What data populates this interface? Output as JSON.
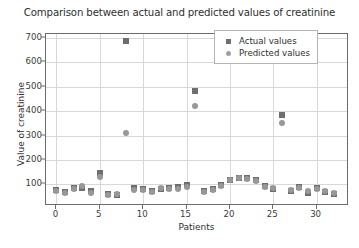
{
  "chart_data": {
    "type": "scatter",
    "title": "Comparison between actual and predicted values of creatinine",
    "xlabel": "Patients",
    "ylabel": "Value of creatinine",
    "xlim": [
      -1.2,
      33.5
    ],
    "ylim": [
      20,
      715
    ],
    "grid": true,
    "legend_position": "upper right",
    "xticks": [
      0,
      5,
      10,
      15,
      20,
      25,
      30
    ],
    "yticks": [
      100,
      200,
      300,
      400,
      500,
      600,
      700
    ],
    "x": [
      0,
      1,
      2,
      3,
      4,
      5,
      6,
      7,
      8,
      9,
      10,
      11,
      12,
      13,
      14,
      15,
      16,
      17,
      18,
      19,
      20,
      21,
      22,
      23,
      24,
      25,
      26,
      27,
      28,
      29,
      30,
      31,
      32
    ],
    "series": [
      {
        "name": "Actual values",
        "marker": "square",
        "color": "#6e6e6e",
        "values": [
          78,
          70,
          84,
          86,
          72,
          148,
          62,
          55,
          685,
          85,
          82,
          74,
          80,
          86,
          88,
          96,
          480,
          72,
          82,
          98,
          120,
          128,
          126,
          120,
          92,
          82,
          385,
          72,
          90,
          66,
          84,
          68,
          62
        ]
      },
      {
        "name": "Predicted values",
        "marker": "circle",
        "color": "#989898",
        "values": [
          74,
          64,
          80,
          92,
          66,
          132,
          58,
          60,
          310,
          78,
          76,
          70,
          86,
          80,
          82,
          90,
          420,
          68,
          78,
          92,
          118,
          126,
          122,
          116,
          88,
          86,
          350,
          78,
          84,
          72,
          80,
          74,
          66
        ]
      }
    ]
  },
  "legend": {
    "entries": [
      {
        "label": "Actual values"
      },
      {
        "label": "Predicted values"
      }
    ]
  }
}
